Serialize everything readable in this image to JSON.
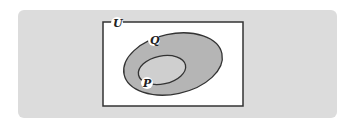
{
  "diagram": {
    "type": "venn",
    "universe_label": "U",
    "sets": [
      {
        "name": "Q",
        "label": "Q",
        "contains": [
          "P"
        ]
      },
      {
        "name": "P",
        "label": "P",
        "subset_of": "Q"
      }
    ],
    "colors": {
      "panel": "#dcdcdc",
      "universe_fill": "#ffffff",
      "outline": "#333333",
      "set_q_fill": "#b5b5b5",
      "set_p_fill": "#cfcfcf"
    }
  }
}
